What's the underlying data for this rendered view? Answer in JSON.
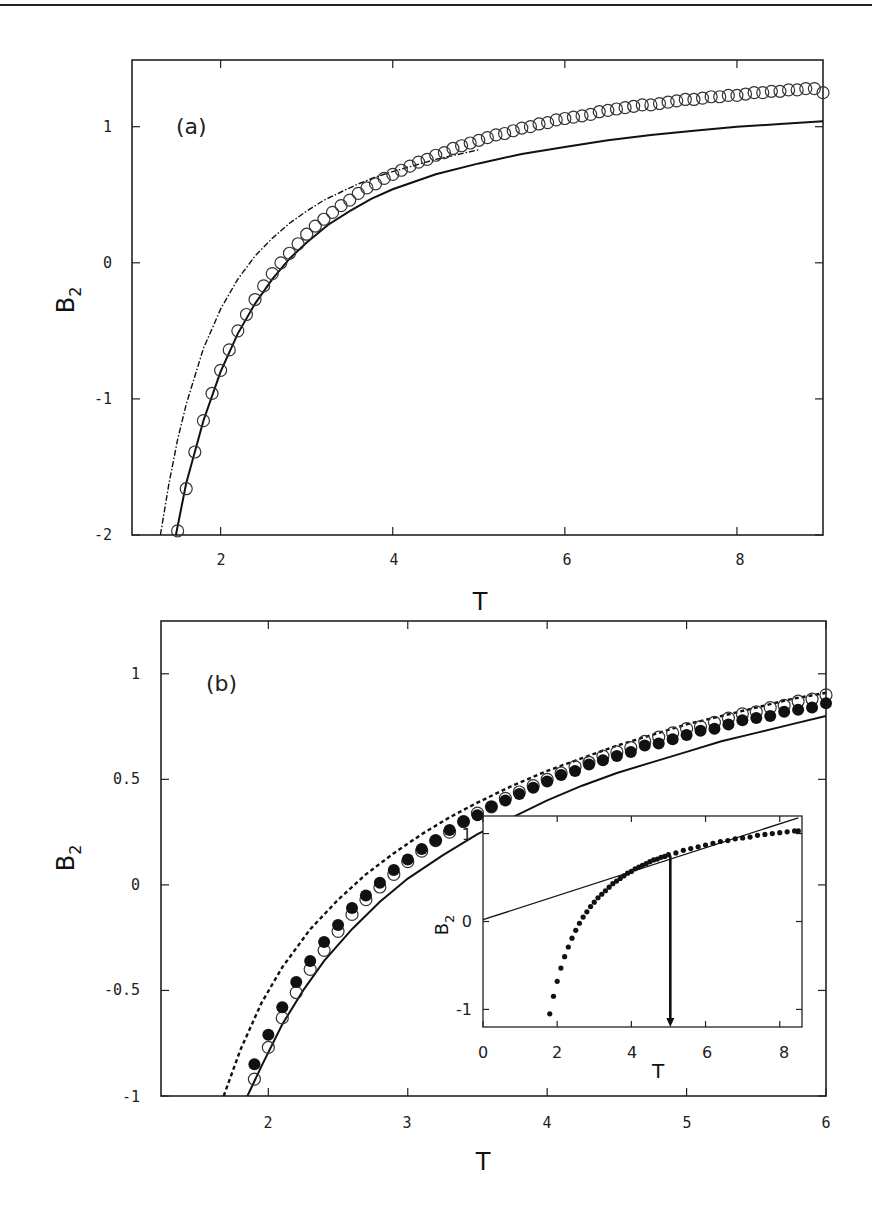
{
  "chart_data": [
    {
      "panel": "(a)",
      "type": "line",
      "title": "",
      "xlabel": "T",
      "ylabel": "B2",
      "xlim": [
        0.97,
        9.0
      ],
      "ylim": [
        -2.0,
        1.49
      ],
      "xticks": [
        2,
        4,
        6,
        8
      ],
      "xtick_labels": [
        "2",
        "4",
        "6",
        "8"
      ],
      "yticks": [
        1,
        0,
        -1,
        -2
      ],
      "ytick_labels": [
        "1",
        "0",
        "-1",
        "-2"
      ],
      "grid": false,
      "legend": "none",
      "series": [
        {
          "name": "open circles",
          "style": "open-circle",
          "x": [
            1.5,
            1.6,
            1.7,
            1.8,
            1.9,
            2.0,
            2.1,
            2.2,
            2.3,
            2.4,
            2.5,
            2.6,
            2.7,
            2.8,
            2.9,
            3.0,
            3.1,
            3.2,
            3.3,
            3.4,
            3.5,
            3.6,
            3.7,
            3.8,
            3.9,
            4.0,
            4.1,
            4.2,
            4.3,
            4.4,
            4.5,
            4.6,
            4.7,
            4.8,
            4.9,
            5.0,
            5.1,
            5.2,
            5.3,
            5.4,
            5.5,
            5.6,
            5.7,
            5.8,
            5.9,
            6.0,
            6.1,
            6.2,
            6.3,
            6.4,
            6.5,
            6.6,
            6.7,
            6.8,
            6.9,
            7.0,
            7.1,
            7.2,
            7.3,
            7.4,
            7.5,
            7.6,
            7.7,
            7.8,
            7.9,
            8.0,
            8.1,
            8.2,
            8.3,
            8.4,
            8.5,
            8.6,
            8.7,
            8.8,
            8.9,
            9.0
          ],
          "y": [
            -1.97,
            -1.66,
            -1.39,
            -1.16,
            -0.96,
            -0.79,
            -0.64,
            -0.5,
            -0.38,
            -0.27,
            -0.17,
            -0.08,
            0.0,
            0.07,
            0.14,
            0.21,
            0.27,
            0.32,
            0.37,
            0.42,
            0.46,
            0.51,
            0.55,
            0.58,
            0.62,
            0.65,
            0.68,
            0.71,
            0.74,
            0.76,
            0.79,
            0.81,
            0.84,
            0.86,
            0.88,
            0.9,
            0.92,
            0.94,
            0.95,
            0.97,
            0.99,
            1.0,
            1.02,
            1.03,
            1.05,
            1.06,
            1.07,
            1.08,
            1.09,
            1.11,
            1.12,
            1.13,
            1.14,
            1.15,
            1.16,
            1.16,
            1.17,
            1.18,
            1.19,
            1.2,
            1.2,
            1.21,
            1.22,
            1.22,
            1.23,
            1.23,
            1.24,
            1.25,
            1.25,
            1.26,
            1.26,
            1.27,
            1.27,
            1.28,
            1.28,
            1.25
          ]
        },
        {
          "name": "solid line",
          "style": "solid",
          "x": [
            1.48,
            1.6,
            1.8,
            2.0,
            2.2,
            2.4,
            2.6,
            2.8,
            3.0,
            3.25,
            3.5,
            3.75,
            4.0,
            4.5,
            5.0,
            5.5,
            6.0,
            6.5,
            7.0,
            7.5,
            8.0,
            8.5,
            9.0
          ],
          "y": [
            -2.0,
            -1.62,
            -1.16,
            -0.8,
            -0.52,
            -0.3,
            -0.12,
            0.03,
            0.15,
            0.28,
            0.38,
            0.47,
            0.54,
            0.65,
            0.73,
            0.8,
            0.85,
            0.9,
            0.94,
            0.97,
            1.0,
            1.02,
            1.04
          ]
        },
        {
          "name": "dash-dot line",
          "style": "dashdot",
          "x": [
            1.3,
            1.4,
            1.5,
            1.6,
            1.8,
            2.0,
            2.2,
            2.4,
            2.6,
            2.8,
            3.0,
            3.2,
            3.4,
            3.6,
            3.8,
            4.0,
            4.5,
            5.0
          ],
          "y": [
            -2.0,
            -1.62,
            -1.3,
            -1.04,
            -0.63,
            -0.34,
            -0.12,
            0.05,
            0.18,
            0.29,
            0.38,
            0.46,
            0.52,
            0.58,
            0.63,
            0.67,
            0.76,
            0.83
          ]
        }
      ]
    },
    {
      "panel": "(b)",
      "type": "line",
      "title": "",
      "xlabel": "T",
      "ylabel": "B2",
      "xlim": [
        1.23,
        6.0
      ],
      "ylim": [
        -1.0,
        1.25
      ],
      "xticks": [
        2,
        3,
        4,
        5,
        6
      ],
      "xtick_labels": [
        "2",
        "3",
        "4",
        "5",
        "6"
      ],
      "yticks": [
        1,
        0.5,
        0,
        -0.5,
        -1
      ],
      "ytick_labels": [
        "1",
        "0.5",
        "0",
        "-0.5",
        "-1"
      ],
      "grid": false,
      "legend": "none",
      "series": [
        {
          "name": "open circles",
          "style": "open-circle",
          "x": [
            1.9,
            2.0,
            2.1,
            2.2,
            2.3,
            2.4,
            2.5,
            2.6,
            2.7,
            2.8,
            2.9,
            3.0,
            3.1,
            3.2,
            3.3,
            3.4,
            3.5,
            3.6,
            3.7,
            3.8,
            3.9,
            4.0,
            4.1,
            4.2,
            4.3,
            4.4,
            4.5,
            4.6,
            4.7,
            4.8,
            4.9,
            5.0,
            5.1,
            5.2,
            5.3,
            5.4,
            5.5,
            5.6,
            5.7,
            5.8,
            5.9,
            6.0
          ],
          "y": [
            -0.92,
            -0.77,
            -0.63,
            -0.51,
            -0.4,
            -0.31,
            -0.22,
            -0.14,
            -0.07,
            -0.01,
            0.05,
            0.11,
            0.16,
            0.21,
            0.25,
            0.3,
            0.34,
            0.37,
            0.41,
            0.44,
            0.47,
            0.5,
            0.53,
            0.56,
            0.58,
            0.61,
            0.63,
            0.65,
            0.68,
            0.7,
            0.72,
            0.74,
            0.75,
            0.77,
            0.79,
            0.81,
            0.82,
            0.84,
            0.85,
            0.87,
            0.88,
            0.9
          ]
        },
        {
          "name": "filled circles",
          "style": "filled-circle",
          "x": [
            1.9,
            2.0,
            2.1,
            2.2,
            2.3,
            2.4,
            2.5,
            2.6,
            2.7,
            2.8,
            2.9,
            3.0,
            3.1,
            3.2,
            3.3,
            3.4,
            3.5,
            3.6,
            3.7,
            3.8,
            3.9,
            4.0,
            4.1,
            4.2,
            4.3,
            4.4,
            4.5,
            4.6,
            4.7,
            4.8,
            4.9,
            5.0,
            5.1,
            5.2,
            5.3,
            5.4,
            5.5,
            5.6,
            5.7,
            5.8,
            5.9,
            6.0
          ],
          "y": [
            -0.85,
            -0.71,
            -0.58,
            -0.46,
            -0.36,
            -0.27,
            -0.19,
            -0.11,
            -0.05,
            0.01,
            0.07,
            0.12,
            0.17,
            0.21,
            0.26,
            0.3,
            0.33,
            0.37,
            0.4,
            0.43,
            0.46,
            0.49,
            0.52,
            0.54,
            0.57,
            0.59,
            0.61,
            0.63,
            0.66,
            0.67,
            0.69,
            0.71,
            0.73,
            0.74,
            0.76,
            0.78,
            0.79,
            0.8,
            0.82,
            0.83,
            0.84,
            0.86
          ]
        },
        {
          "name": "solid line",
          "style": "solid",
          "x": [
            1.85,
            1.95,
            2.1,
            2.25,
            2.4,
            2.6,
            2.8,
            3.0,
            3.25,
            3.5,
            3.75,
            4.0,
            4.25,
            4.5,
            4.75,
            5.0,
            5.25,
            5.5,
            5.75,
            6.0
          ],
          "y": [
            -1.0,
            -0.86,
            -0.66,
            -0.5,
            -0.36,
            -0.21,
            -0.08,
            0.03,
            0.14,
            0.24,
            0.32,
            0.4,
            0.47,
            0.53,
            0.58,
            0.63,
            0.68,
            0.72,
            0.76,
            0.8
          ]
        },
        {
          "name": "dashed line",
          "style": "dashed",
          "x": [
            1.68,
            1.8,
            1.95,
            2.1,
            2.3,
            2.5,
            2.7,
            2.9,
            3.1,
            3.3,
            3.5,
            3.75,
            4.0,
            4.25,
            4.5,
            4.75,
            5.0,
            5.25,
            5.5,
            5.75,
            6.0
          ],
          "y": [
            -1.0,
            -0.78,
            -0.56,
            -0.39,
            -0.21,
            -0.07,
            0.05,
            0.15,
            0.24,
            0.32,
            0.39,
            0.47,
            0.54,
            0.6,
            0.66,
            0.71,
            0.76,
            0.8,
            0.84,
            0.88,
            0.91
          ]
        }
      ],
      "inset": {
        "type": "scatter",
        "xlabel": "T",
        "ylabel": "B2",
        "xlim": [
          0,
          8.6
        ],
        "ylim": [
          -1.2,
          1.2
        ],
        "xticks": [
          0,
          2,
          4,
          6,
          8
        ],
        "xtick_labels": [
          "0",
          "2",
          "4",
          "6",
          "8"
        ],
        "yticks": [
          1,
          0,
          -1
        ],
        "ytick_labels": [
          "1",
          "0",
          "-1"
        ],
        "series": [
          {
            "name": "filled dots",
            "style": "small-dot",
            "x": [
              1.8,
              1.9,
              2.0,
              2.1,
              2.2,
              2.3,
              2.4,
              2.5,
              2.6,
              2.7,
              2.8,
              2.9,
              3.0,
              3.1,
              3.2,
              3.3,
              3.4,
              3.5,
              3.6,
              3.7,
              3.8,
              3.9,
              4.0,
              4.1,
              4.2,
              4.3,
              4.4,
              4.5,
              4.6,
              4.7,
              4.8,
              4.9,
              5.0,
              5.2,
              5.4,
              5.6,
              5.8,
              6.0,
              6.2,
              6.4,
              6.6,
              6.8,
              7.0,
              7.2,
              7.4,
              7.6,
              7.8,
              8.0,
              8.2,
              8.4,
              8.5
            ],
            "y": [
              -1.05,
              -0.85,
              -0.68,
              -0.53,
              -0.4,
              -0.29,
              -0.19,
              -0.1,
              -0.02,
              0.05,
              0.11,
              0.17,
              0.22,
              0.27,
              0.31,
              0.35,
              0.39,
              0.43,
              0.46,
              0.49,
              0.52,
              0.55,
              0.57,
              0.6,
              0.62,
              0.64,
              0.66,
              0.68,
              0.7,
              0.71,
              0.73,
              0.74,
              0.76,
              0.78,
              0.81,
              0.83,
              0.85,
              0.87,
              0.89,
              0.91,
              0.92,
              0.94,
              0.95,
              0.96,
              0.98,
              0.99,
              1.0,
              1.01,
              1.02,
              1.03,
              1.03
            ]
          },
          {
            "name": "tangent line",
            "style": "thin-solid",
            "x": [
              0,
              8.5
            ],
            "y": [
              0.02,
              1.18
            ]
          }
        ],
        "annotations": [
          {
            "type": "arrow",
            "x": 5.05,
            "from_y": 0.75,
            "to_y": -1.2,
            "text": ""
          }
        ]
      }
    }
  ],
  "panels": {
    "a": {
      "label": "(a)",
      "xlabel": "T",
      "ylabel_main": "B",
      "ylabel_sub": "2",
      "xtick_labels": [
        "2",
        "4",
        "6",
        "8"
      ],
      "ytick_labels": [
        "1",
        "0",
        "-1",
        "-2"
      ]
    },
    "b": {
      "label": "(b)",
      "xlabel": "T",
      "ylabel_main": "B",
      "ylabel_sub": "2",
      "xtick_labels": [
        "2",
        "3",
        "4",
        "5",
        "6"
      ],
      "ytick_labels": [
        "1",
        "0.5",
        "0",
        "-0.5",
        "-1"
      ],
      "inset": {
        "xlabel": "T",
        "ylabel_main": "B",
        "ylabel_sub": "2",
        "xtick_labels": [
          "0",
          "2",
          "4",
          "6",
          "8"
        ],
        "ytick_labels": [
          "1",
          "0",
          "-1"
        ]
      }
    }
  }
}
